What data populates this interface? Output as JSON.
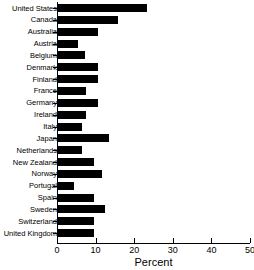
{
  "chart_data": {
    "type": "bar",
    "orientation": "horizontal",
    "title": "",
    "xlabel": "Percent",
    "ylabel": "",
    "xlim": [
      0,
      50
    ],
    "xticks": [
      0,
      10,
      20,
      30,
      40,
      50
    ],
    "xtick_labels": [
      "0",
      "10",
      "20",
      "30",
      "40",
      "50"
    ],
    "grid": false,
    "legend": null,
    "bar_color": "#000000",
    "categories": [
      "United States",
      "Canada",
      "Australia",
      "Austria",
      "Belgium",
      "Denmark",
      "Finland",
      "France",
      "Germany",
      "Ireland",
      "Italy",
      "Japan",
      "Netherlands",
      "New Zealand",
      "Norway",
      "Portugal",
      "Spain",
      "Sweden",
      "Switzerland",
      "United Kingdom"
    ],
    "values": [
      23.1,
      15.5,
      10.4,
      5.2,
      7.0,
      10.3,
      10.3,
      7.2,
      10.3,
      7.2,
      6.3,
      13.2,
      6.3,
      9.3,
      11.3,
      4.2,
      9.3,
      12.2,
      9.4,
      9.4
    ]
  }
}
